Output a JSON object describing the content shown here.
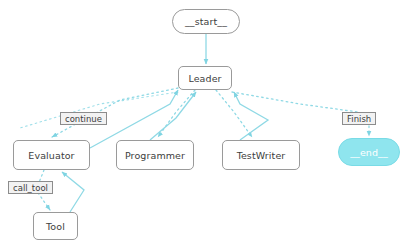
{
  "diagram": {
    "type": "flowchart",
    "colors": {
      "edge": "#8fd9e5",
      "node_border": "#9a9a9a",
      "node_fill": "#ffffff",
      "node_text": "#3d3d3d",
      "terminal_fill": "#8fe5ee",
      "terminal_border": "#79dbe6",
      "terminal_text": "#ffffff",
      "label_fill": "#f2f2f2",
      "label_border": "#8c8c8c",
      "background": "#ffffff"
    },
    "nodes": [
      {
        "id": "start",
        "label": "__start__",
        "shape": "pill",
        "x": 172,
        "y": 9,
        "w": 68,
        "h": 25,
        "style": "default"
      },
      {
        "id": "leader",
        "label": "Leader",
        "shape": "rect",
        "x": 178,
        "y": 66,
        "w": 54,
        "h": 24,
        "style": "default"
      },
      {
        "id": "evaluator",
        "label": "Evaluator",
        "shape": "rect",
        "x": 13,
        "y": 140,
        "w": 77,
        "h": 30,
        "style": "default"
      },
      {
        "id": "programmer",
        "label": "Programmer",
        "shape": "rect",
        "x": 116,
        "y": 140,
        "w": 78,
        "h": 30,
        "style": "default"
      },
      {
        "id": "testwriter",
        "label": "TestWriter",
        "shape": "rect",
        "x": 222,
        "y": 140,
        "w": 78,
        "h": 30,
        "style": "default"
      },
      {
        "id": "tool",
        "label": "Tool",
        "shape": "rect",
        "x": 33,
        "y": 212,
        "w": 45,
        "h": 28,
        "style": "default"
      },
      {
        "id": "end",
        "label": "__end__",
        "shape": "pill",
        "x": 338,
        "y": 138,
        "w": 62,
        "h": 28,
        "style": "terminal"
      }
    ],
    "edge_labels": [
      {
        "id": "continue",
        "text": "continue",
        "x": 60,
        "y": 112
      },
      {
        "id": "call_tool",
        "text": "call_tool",
        "x": 8,
        "y": 181
      },
      {
        "id": "finish",
        "text": "Finish",
        "x": 342,
        "y": 112
      }
    ],
    "edges": [
      {
        "from": "start",
        "to": "leader",
        "style": "solid",
        "kind": "entry"
      },
      {
        "from": "leader",
        "to": "evaluator",
        "style": "dotted",
        "kind": "dispatch",
        "label": "continue"
      },
      {
        "from": "leader",
        "to": "programmer",
        "style": "dotted",
        "kind": "dispatch"
      },
      {
        "from": "leader",
        "to": "testwriter",
        "style": "dotted",
        "kind": "dispatch"
      },
      {
        "from": "leader",
        "to": "end",
        "style": "dotted",
        "kind": "dispatch",
        "label": "Finish"
      },
      {
        "from": "evaluator",
        "to": "leader",
        "style": "solid",
        "kind": "return"
      },
      {
        "from": "programmer",
        "to": "leader",
        "style": "solid",
        "kind": "return"
      },
      {
        "from": "testwriter",
        "to": "leader",
        "style": "solid",
        "kind": "return"
      },
      {
        "from": "evaluator",
        "to": "tool",
        "style": "dotted",
        "kind": "dispatch",
        "label": "call_tool"
      },
      {
        "from": "tool",
        "to": "evaluator",
        "style": "solid",
        "kind": "return"
      }
    ]
  }
}
